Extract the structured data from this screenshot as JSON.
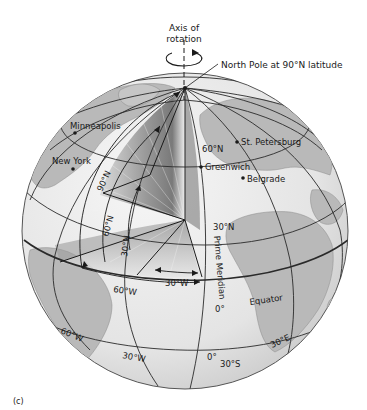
{
  "figure": {
    "panel_label": "(c)",
    "axis_label_line1": "Axis of",
    "axis_label_line2": "rotation",
    "north_pole_label": "North Pole at 90°N latitude",
    "cities": [
      {
        "name": "Minneapolis"
      },
      {
        "name": "New York"
      },
      {
        "name": "St. Petersburg"
      },
      {
        "name": "Greenwich"
      },
      {
        "name": "Belgrade"
      }
    ],
    "latitude_labels": {
      "lat60_surface": "60°N",
      "lat30_surface": "30°N",
      "equator": "Equator",
      "origin": "0°",
      "lat30s": "30°S"
    },
    "angle_labels": {
      "a90n": "90°N",
      "a60n": "60°N",
      "a30n": "30°N",
      "a60w": "60°W",
      "a30w": "30°W"
    },
    "meridian_labels": {
      "prime_meridian": "Prime Meridian",
      "m60w": "60°W",
      "m30w": "30°W",
      "m0": "0°",
      "m30e": "30°E"
    },
    "colors": {
      "ocean": "#ececec",
      "land": "#b9b9b9",
      "grid": "#2a2a2a",
      "wedge_dark": "#7a7a7a"
    }
  }
}
